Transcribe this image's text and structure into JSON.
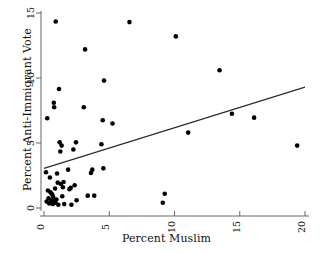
{
  "chart_data": {
    "type": "scatter",
    "title": "",
    "xlabel": "Percent Muslim",
    "ylabel": "Percent Anti-Immigrant Vote",
    "xlim": [
      -0.35,
      20.5
    ],
    "ylim": [
      -0.55,
      15.4
    ],
    "xticks": [
      0,
      5,
      10,
      15,
      20
    ],
    "xtick_labels": [
      "0",
      "5",
      "10",
      "15",
      "20"
    ],
    "yticks": [
      0,
      5,
      10,
      15
    ],
    "ytick_labels": [
      "0",
      "5",
      "10",
      "15"
    ],
    "grid": false,
    "legend": null,
    "point_color": "#000000",
    "line_color": "#2b2b2b",
    "series": [
      {
        "name": "countries",
        "marker": "filled-circle",
        "points": [
          [
            0.15,
            2.75
          ],
          [
            0.2,
            0.5
          ],
          [
            0.25,
            6.9
          ],
          [
            0.3,
            1.35
          ],
          [
            0.35,
            0.75
          ],
          [
            0.4,
            0.35
          ],
          [
            0.45,
            2.35
          ],
          [
            0.5,
            1.2
          ],
          [
            0.55,
            0.55
          ],
          [
            0.6,
            0.45
          ],
          [
            0.62,
            1.05
          ],
          [
            0.68,
            0.3
          ],
          [
            0.7,
            0.85
          ],
          [
            0.75,
            8.1
          ],
          [
            0.78,
            7.75
          ],
          [
            0.8,
            0.6
          ],
          [
            0.85,
            1.5
          ],
          [
            0.88,
            0.4
          ],
          [
            0.9,
            14.35
          ],
          [
            0.95,
            0.65
          ],
          [
            1.0,
            2.65
          ],
          [
            1.05,
            1.95
          ],
          [
            1.1,
            0.25
          ],
          [
            1.15,
            9.15
          ],
          [
            1.2,
            5.05
          ],
          [
            1.25,
            4.35
          ],
          [
            1.3,
            1.85
          ],
          [
            1.35,
            4.8
          ],
          [
            1.4,
            0.9
          ],
          [
            1.45,
            1.6
          ],
          [
            1.5,
            2.0
          ],
          [
            1.55,
            0.3
          ],
          [
            1.85,
            2.95
          ],
          [
            1.95,
            1.45
          ],
          [
            2.05,
            1.55
          ],
          [
            2.1,
            0.25
          ],
          [
            2.25,
            4.5
          ],
          [
            2.35,
            1.75
          ],
          [
            2.45,
            5.05
          ],
          [
            2.5,
            0.6
          ],
          [
            3.05,
            7.75
          ],
          [
            3.15,
            12.2
          ],
          [
            3.35,
            0.95
          ],
          [
            3.6,
            2.7
          ],
          [
            3.7,
            2.95
          ],
          [
            3.85,
            0.95
          ],
          [
            4.4,
            4.9
          ],
          [
            4.5,
            6.75
          ],
          [
            4.55,
            3.05
          ],
          [
            4.6,
            9.8
          ],
          [
            5.25,
            6.5
          ],
          [
            6.55,
            14.3
          ],
          [
            9.1,
            0.4
          ],
          [
            9.25,
            1.1
          ],
          [
            10.1,
            13.2
          ],
          [
            11.05,
            5.8
          ],
          [
            13.45,
            10.6
          ],
          [
            14.4,
            7.25
          ],
          [
            16.1,
            6.95
          ],
          [
            19.4,
            4.8
          ]
        ]
      }
    ],
    "fit_line": {
      "name": "regression-line",
      "x": [
        0.0,
        20.0
      ],
      "y": [
        3.05,
        9.3
      ]
    }
  }
}
